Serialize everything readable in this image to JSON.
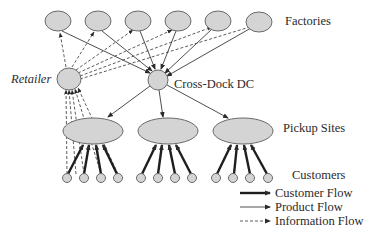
{
  "diagram": {
    "labels": {
      "factories": "Factories",
      "retailer": "Retailer",
      "cross_dock": "Cross-Dock DC",
      "pickup_sites": "Pickup Sites",
      "customers": "Customers"
    },
    "legend": [
      {
        "style": "thick-solid",
        "label": "Customer Flow"
      },
      {
        "style": "thin-solid",
        "label": "Product Flow"
      },
      {
        "style": "dashed",
        "label": "Information Flow"
      }
    ],
    "nodes": {
      "factories_count": 6,
      "retailer_count": 1,
      "cross_dock_count": 1,
      "pickup_sites_count": 3,
      "customers_per_site": 4
    },
    "colors": {
      "node_fill": "#d4d4d4",
      "node_stroke": "#6a6a6a",
      "line": "#2a2a2a"
    }
  }
}
